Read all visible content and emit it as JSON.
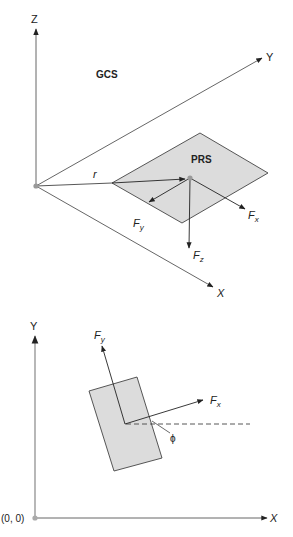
{
  "top_diagram": {
    "axes": {
      "z": "Z",
      "y": "Y",
      "x": "X"
    },
    "frame_label": "GCS",
    "plate_label": "PRS",
    "position_vector": "r",
    "forces": {
      "fx": "F",
      "fx_sub": "x",
      "fy": "F",
      "fy_sub": "y",
      "fz": "F",
      "fz_sub": "z"
    }
  },
  "bottom_diagram": {
    "axes": {
      "y": "Y",
      "x": "X"
    },
    "origin_label": "(0, 0)",
    "forces": {
      "fx": "F",
      "fx_sub": "x",
      "fy": "F",
      "fy_sub": "y"
    },
    "angle_label": "ϕ"
  },
  "colors": {
    "line": "#333333",
    "axis": "#555555",
    "plate_fill": "#dcdcdc",
    "origin_dot": "#999999"
  }
}
